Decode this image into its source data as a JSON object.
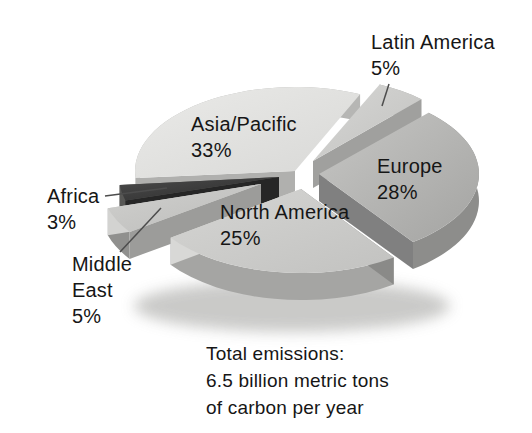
{
  "chart_data": {
    "type": "pie",
    "title": "",
    "unit": "%",
    "legend": "none",
    "style": "3d-exploded-grayscale",
    "annotation": {
      "text": "Total emissions:\n6.5 billion metric tons\nof carbon per year"
    },
    "geometry": {
      "cx": 295,
      "cy": 174,
      "rx": 160,
      "ry": 84,
      "depth": 27,
      "start_angle_deg": 66,
      "gap_deg": 0.6
    },
    "shadow": {
      "cx": 292,
      "cy": 306,
      "rx": 158,
      "ry": 26,
      "color": "#c5c5c3"
    },
    "slices": [
      {
        "name": "Asia/Pacific",
        "value": 33,
        "label_text": "Asia/Pacific\n33%",
        "offset": [
          0,
          -3
        ],
        "z": 0,
        "colors": {
          "top": [
            "#eaeae8",
            "#d8d8d6"
          ],
          "arc": "#b6b6b4",
          "wall1": "#c0c0be",
          "wall2": "#b0b0ae"
        },
        "walls": {
          "arc": true,
          "a1": false,
          "a2": true
        }
      },
      {
        "name": "Africa",
        "value": 3,
        "label_text": "Africa\n3%",
        "offset": [
          -16,
          3
        ],
        "z": 2,
        "colors": {
          "top": [
            "#4c4c4c",
            "#2a2a2a"
          ],
          "arc": "#1e1e1e",
          "wall1": "#575755",
          "wall2": "#262626"
        },
        "walls": {
          "arc": true,
          "a1": true,
          "a2": true
        }
      },
      {
        "name": "Middle East",
        "value": 5,
        "label_text": "Middle\nEast\n5%",
        "offset": [
          -34,
          10
        ],
        "z": 3,
        "colors": {
          "top": [
            "#d0d0ce",
            "#bcbcba"
          ],
          "arc": "#90908e",
          "wall1": "#d3d3d1",
          "wall2": "#9c9c9a"
        },
        "walls": {
          "arc": true,
          "a1": true,
          "a2": true
        }
      },
      {
        "name": "North America",
        "value": 25,
        "label_text": "North America\n25%",
        "offset": [
          6,
          15
        ],
        "z": 5,
        "colors": {
          "top": [
            "#d5d5d3",
            "#c2c2c0"
          ],
          "arc": "#a5a5a3",
          "wall1": "#d8d8d6",
          "wall2": "#8a8a88"
        },
        "walls": {
          "arc": true,
          "a1": true,
          "a2": true
        }
      },
      {
        "name": "Europe",
        "value": 28,
        "label_text": "Europe\n28%",
        "offset": [
          24,
          0
        ],
        "z": 4,
        "colors": {
          "top": [
            "#c6c6c4",
            "#a4a4a2"
          ],
          "arc": "#8d8d8b",
          "wall1": "#808080",
          "wall2": "#cfcfcd"
        },
        "walls": {
          "arc": true,
          "a1": true,
          "a2": false
        }
      },
      {
        "name": "Latin America",
        "value": 5,
        "label_text": "Latin America\n5%",
        "offset": [
          18,
          -13
        ],
        "z": 1,
        "colors": {
          "top": [
            "#d6d6d4",
            "#c2c2c0"
          ],
          "arc": "#a9a9a7",
          "wall1": "#a0a09e",
          "wall2": "#c8c8c6"
        },
        "walls": {
          "arc": true,
          "a1": true,
          "a2": false
        }
      }
    ],
    "leader_line_color": "#4d4d4d"
  }
}
